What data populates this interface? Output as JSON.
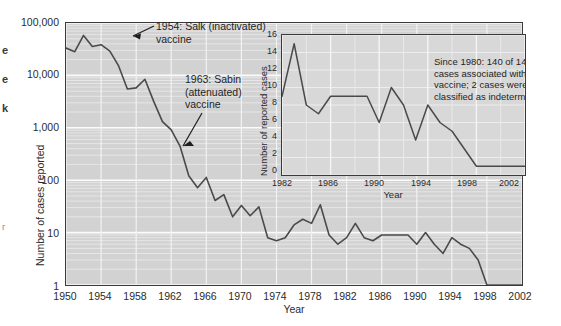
{
  "margin_fragments": [
    "e",
    "e",
    "k",
    "r"
  ],
  "main": {
    "ylabel": "Number of cases reported",
    "xlabel": "Year",
    "yticks": [
      "100,000",
      "10,000",
      "1,000",
      "100",
      "10",
      "1"
    ],
    "xticks": [
      "1950",
      "1954",
      "1958",
      "1962",
      "1966",
      "1970",
      "1974",
      "1978",
      "1982",
      "1986",
      "1990",
      "1994",
      "1998",
      "2002"
    ],
    "annotations": [
      {
        "id": "salk",
        "text": "1954: Salk (inactivated)\nvaccine"
      },
      {
        "id": "sabin",
        "text": "1963: Sabin\n(attenuated)\nvaccine"
      }
    ]
  },
  "inset": {
    "ylabel": "Number of reported cases",
    "xlabel": "Year",
    "yticks": [
      "16",
      "14",
      "12",
      "10",
      "8",
      "6",
      "4",
      "2",
      "0"
    ],
    "xticks": [
      "1982",
      "1986",
      "1990",
      "1994",
      "1998",
      "2002"
    ],
    "note": "Since 1980: 140 of 142 cases associated with oral vaccine; 2 cases were classified as indeterminate."
  },
  "colors": {
    "plot_background": "#d2d2d2",
    "inset_background": "#d8d8d8",
    "line": "#4a4a4a",
    "axis": "#3a3a3a",
    "gridline": "#f0f0f0",
    "text": "#2b2b2b"
  },
  "chart_data": {
    "type": "line",
    "xlabel": "Year",
    "ylabel": "Number of cases reported",
    "yscale": "log",
    "ylim": [
      1,
      100000
    ],
    "xlim": [
      1950,
      2002
    ],
    "grid": true,
    "legend": "none",
    "series": [
      {
        "name": "Reported polio cases (main chart)",
        "x": [
          1950,
          1951,
          1952,
          1953,
          1954,
          1955,
          1956,
          1957,
          1958,
          1959,
          1960,
          1961,
          1962,
          1963,
          1964,
          1965,
          1966,
          1967,
          1968,
          1969,
          1970,
          1971,
          1972,
          1973,
          1974,
          1975,
          1976,
          1977,
          1978,
          1979,
          1980,
          1981,
          1982,
          1983,
          1984,
          1985,
          1986,
          1987,
          1988,
          1989,
          1990,
          1991,
          1992,
          1993,
          1994,
          1995,
          1996,
          1997,
          1998,
          1999,
          2000,
          2001,
          2002
        ],
        "y": [
          33300,
          28400,
          58000,
          35600,
          38500,
          28985,
          15140,
          5485,
          5787,
          8425,
          3190,
          1312,
          910,
          449,
          122,
          72,
          113,
          41,
          53,
          20,
          33,
          21,
          31,
          8,
          7,
          8,
          14,
          18,
          15,
          34,
          9,
          6,
          8,
          15,
          8,
          7,
          9,
          9,
          9,
          9,
          6,
          10,
          6,
          4,
          8,
          6,
          5,
          3,
          1,
          1,
          1,
          1,
          1
        ]
      }
    ],
    "annotations": [
      {
        "text": "1954: Salk (inactivated) vaccine",
        "x": 1954,
        "y": 38500
      },
      {
        "text": "1963: Sabin (attenuated) vaccine",
        "x": 1963,
        "y": 449
      }
    ],
    "inset_chart": {
      "type": "line",
      "xlabel": "Year",
      "ylabel": "Number of reported cases",
      "yscale": "linear",
      "ylim": [
        0,
        16
      ],
      "xlim": [
        1982,
        2002
      ],
      "grid": true,
      "series": [
        {
          "name": "Vaccine-associated paralytic polio cases",
          "x": [
            1982,
            1983,
            1984,
            1985,
            1986,
            1987,
            1988,
            1989,
            1990,
            1991,
            1992,
            1993,
            1994,
            1995,
            1996,
            1997,
            1998,
            1999,
            2000,
            2001,
            2002
          ],
          "y": [
            9,
            15,
            8,
            7,
            9,
            9,
            9,
            9,
            6,
            10,
            8,
            4,
            8,
            6,
            5,
            3,
            1,
            1,
            1,
            1,
            1
          ]
        }
      ],
      "note": "Since 1980: 140 of 142 cases associated with oral vaccine; 2 cases were classified as indeterminate."
    }
  }
}
